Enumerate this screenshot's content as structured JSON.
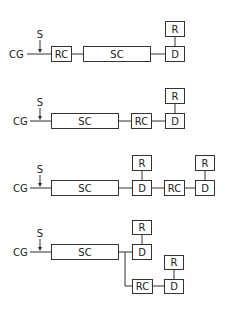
{
  "labels": {
    "cg": "CG",
    "s": "S",
    "rc": "RC",
    "sc": "SC",
    "d": "D",
    "r": "R"
  },
  "diagrams": [
    {
      "id": 1,
      "order": [
        "CG",
        "RC",
        "SC",
        "D"
      ],
      "R_over": [
        "D"
      ]
    },
    {
      "id": 2,
      "order": [
        "CG",
        "SC",
        "RC",
        "D"
      ],
      "R_over": [
        "D"
      ]
    },
    {
      "id": 3,
      "order": [
        "CG",
        "SC",
        "D",
        "RC",
        "D"
      ],
      "R_over": [
        "D",
        "D"
      ]
    },
    {
      "id": 4,
      "order": [
        "CG",
        "SC",
        "D | RC",
        "D"
      ],
      "R_over": [
        "D",
        "D"
      ]
    }
  ]
}
